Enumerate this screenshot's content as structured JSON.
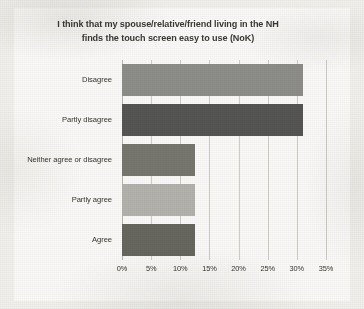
{
  "chart_data": {
    "type": "bar",
    "orientation": "horizontal",
    "title": "I think that my spouse/relative/friend living in the NH finds the touch screen easy to use (NoK)",
    "title_lines": [
      "I think that my spouse/relative/friend living in the NH",
      "finds the touch screen easy to use (NoK)"
    ],
    "xlabel": "",
    "ylabel": "",
    "categories": [
      "Disagree",
      "Partly disagree",
      "Neither agree or disagree",
      "Partly agree",
      "Agree"
    ],
    "values": [
      31,
      31,
      12.5,
      12.5,
      12.5
    ],
    "value_labels": [
      "31%",
      "31%",
      "12.5%",
      "12.5%",
      "12.5%"
    ],
    "xlim": [
      0,
      35
    ],
    "xtick_values": [
      0,
      5,
      10,
      15,
      20,
      25,
      30,
      35
    ],
    "xtick_labels": [
      "0%",
      "5%",
      "10%",
      "15%",
      "20%",
      "25%",
      "30%",
      "35%"
    ],
    "grid": true,
    "grid_axis": "x",
    "legend": false,
    "legend_position": "none",
    "bar_colors": [
      "#8d8d8a",
      "#555553",
      "#77766f",
      "#b3b2ad",
      "#67665f"
    ],
    "plot_background": "#fbfaf8",
    "page_background": "#f2f1ed",
    "gridline_color": "#cfcdc8",
    "text_color": "#35342f"
  }
}
